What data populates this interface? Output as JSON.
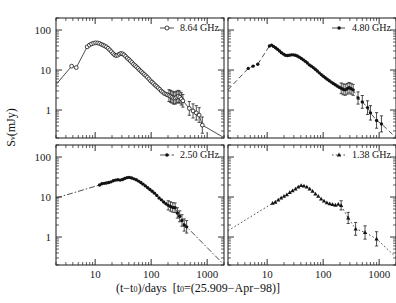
{
  "figure": {
    "title": "",
    "xlabel_parts": {
      "main": "(t−t",
      "sub": "0",
      "after": ")/days  [t",
      "sub2": "0",
      "tail": "=(25.909−Apr−98)]"
    },
    "xlabel_full": "(t−t0)/days [t0=(25.909−Apr−98)]",
    "ylabel_full": "Sν(mJy)",
    "ylabel_parts": {
      "s": "S",
      "nu": "ν",
      "unit": "(mJy)"
    },
    "background_color": "#ffffff",
    "axis_color": "#1a1a1a",
    "curve_color": "#3a3a3a",
    "marker_color": "#121212"
  },
  "chart_data": {
    "type": "scatter",
    "title": "",
    "xlabel": "(t−t0)/days [t0=(25.909−Apr−98)]",
    "ylabel": "Sν(mJy)",
    "xscale": "log",
    "yscale": "log",
    "xlim": [
      2,
      2000
    ],
    "ylim": [
      0.2,
      200
    ],
    "xticks": [
      10,
      100,
      1000
    ],
    "xticklabels": [
      "10",
      "100",
      "1000"
    ],
    "yticks": [
      1,
      10,
      100
    ],
    "yticklabels": [
      "1",
      "10",
      "100"
    ],
    "grid": false,
    "legend_position": "top-right-inside",
    "panel_layout": "2x2",
    "panels": [
      {
        "id": "panel-8-64",
        "row": 0,
        "col": 0,
        "legend_label": "8.64 GHz",
        "frequency_ghz": 8.64,
        "marker": "open-circle",
        "linestyle": "solid",
        "series": [
          {
            "name": "8.64 GHz",
            "x": [
              3.8,
              4.6,
              7.2,
              7.9,
              8.6,
              9.4,
              10.2,
              11.1,
              12.0,
              12.9,
              13.8,
              14.8,
              15.9,
              17.0,
              18.2,
              19.5,
              20.8,
              22.2,
              23.7,
              25.3,
              27.0,
              28.8,
              30.8,
              32.8,
              35.0,
              37.3,
              39.8,
              42.4,
              45.2,
              48.2,
              51.4,
              54.8,
              58.4,
              62.2,
              66.3,
              70.6,
              75.3,
              80.2,
              85.5,
              91.1,
              97.1,
              103.5,
              110.3,
              117.5,
              125.2,
              133.4,
              142.2,
              151.5,
              161.4,
              172.0,
              183.3,
              195.3,
              208.1,
              221.8,
              236.3,
              251.8,
              268.3,
              285.9,
              304.7,
              324.7,
              346.0,
              368.7,
              480.0,
              560.0,
              640.0,
              720.0,
              820.0
            ],
            "y": [
              12.5,
              11.5,
              38.0,
              42.0,
              45.0,
              47.0,
              48.0,
              47.5,
              46.0,
              44.0,
              42.0,
              40.0,
              38.0,
              35.0,
              32.0,
              29.0,
              26.0,
              24.0,
              23.0,
              23.5,
              25.0,
              26.0,
              25.5,
              24.0,
              22.0,
              20.0,
              18.5,
              17.0,
              15.5,
              14.0,
              13.0,
              12.0,
              11.0,
              10.0,
              9.2,
              8.5,
              7.8,
              7.2,
              6.6,
              6.0,
              5.4,
              5.0,
              4.6,
              4.2,
              3.9,
              3.6,
              3.3,
              3.0,
              2.8,
              2.6,
              2.5,
              2.4,
              2.3,
              2.2,
              2.1,
              2.0,
              2.0,
              2.1,
              2.2,
              2.1,
              1.9,
              1.7,
              1.1,
              0.95,
              0.85,
              0.75,
              0.42
            ]
          }
        ]
      },
      {
        "id": "panel-4-80",
        "row": 0,
        "col": 1,
        "legend_label": "4.80 GHz",
        "frequency_ghz": 4.8,
        "marker": "filled-circle",
        "linestyle": "dashed",
        "series": [
          {
            "name": "4.80 GHz",
            "x": [
              4.6,
              5.6,
              6.8,
              11.0,
              12.0,
              13.0,
              14.1,
              15.3,
              16.6,
              18.0,
              19.6,
              21.2,
              23.0,
              25.0,
              27.1,
              29.4,
              31.9,
              34.6,
              37.6,
              40.8,
              44.3,
              48.1,
              52.2,
              56.6,
              61.5,
              66.7,
              72.4,
              78.6,
              85.3,
              92.6,
              100.5,
              109.1,
              118.4,
              128.5,
              139.5,
              151.4,
              164.3,
              178.3,
              193.5,
              210.0,
              228.0,
              247.4,
              268.6,
              291.5,
              316.4,
              343.4,
              420.0,
              500.0,
              620.0,
              700.0,
              900.0,
              1100.0
            ],
            "y": [
              11.0,
              12.5,
              14.0,
              40.0,
              42.0,
              39.0,
              36.0,
              33.0,
              30.0,
              27.0,
              25.0,
              23.5,
              23.0,
              23.5,
              24.0,
              24.0,
              23.5,
              22.5,
              21.0,
              19.5,
              18.0,
              16.5,
              15.0,
              13.5,
              12.5,
              11.5,
              10.5,
              9.5,
              8.5,
              7.7,
              7.0,
              6.4,
              5.9,
              5.4,
              5.0,
              4.6,
              4.3,
              4.0,
              3.7,
              3.5,
              3.3,
              3.2,
              3.4,
              3.6,
              3.4,
              3.2,
              2.0,
              1.6,
              1.15,
              0.85,
              0.55,
              0.45
            ]
          }
        ]
      },
      {
        "id": "panel-2-50",
        "row": 1,
        "col": 0,
        "legend_label": "2.50 GHz",
        "frequency_ghz": 2.5,
        "marker": "filled-circle",
        "linestyle": "dash-dot",
        "series": [
          {
            "name": "2.50 GHz",
            "x": [
              12.0,
              13.2,
              14.5,
              15.9,
              17.5,
              19.2,
              21.1,
              23.2,
              25.5,
              28.0,
              30.8,
              33.8,
              37.1,
              40.8,
              44.8,
              49.2,
              54.1,
              59.4,
              65.3,
              71.7,
              78.8,
              86.6,
              95.1,
              104.5,
              114.8,
              126.1,
              138.5,
              152.2,
              167.2,
              183.7,
              201.8,
              221.7,
              243.6,
              267.6,
              294.0,
              323.0,
              355.0,
              390.0,
              430.0
            ],
            "y": [
              20.0,
              21.5,
              22.0,
              22.5,
              23.0,
              24.0,
              25.5,
              26.5,
              27.0,
              26.5,
              27.5,
              29.0,
              30.5,
              31.0,
              30.0,
              28.5,
              27.0,
              25.0,
              23.0,
              21.0,
              19.0,
              17.0,
              15.5,
              14.0,
              12.5,
              11.0,
              9.5,
              8.5,
              7.5,
              6.8,
              6.2,
              5.8,
              5.5,
              5.4,
              4.0,
              3.3,
              2.6,
              2.0,
              1.8
            ]
          }
        ]
      },
      {
        "id": "panel-1-38",
        "row": 1,
        "col": 1,
        "legend_label": "1.38 GHz",
        "frequency_ghz": 1.38,
        "marker": "filled-triangle",
        "linestyle": "dotted",
        "series": [
          {
            "name": "1.38 GHz",
            "x": [
              12.5,
              14.0,
              15.8,
              17.8,
              20.0,
              22.5,
              25.3,
              28.4,
              32.0,
              36.0,
              40.5,
              45.5,
              51.2,
              57.6,
              64.8,
              72.8,
              81.9,
              92.1,
              103.6,
              116.5,
              131.0,
              147.3,
              165.7,
              186.3,
              209.5,
              280.0,
              380.0,
              560.0,
              900.0
            ],
            "y": [
              7.0,
              7.5,
              8.5,
              9.5,
              10.5,
              11.5,
              13.0,
              14.5,
              16.0,
              18.0,
              19.5,
              19.0,
              18.0,
              16.0,
              14.0,
              12.0,
              10.5,
              9.0,
              8.0,
              7.2,
              6.8,
              6.5,
              6.3,
              6.6,
              6.2,
              3.0,
              1.6,
              1.3,
              0.9
            ]
          }
        ]
      }
    ]
  },
  "legend": {
    "entries": [
      {
        "id": "legend-8-64",
        "label": "8.64 GHz",
        "marker": "open-circle"
      },
      {
        "id": "legend-4-80",
        "label": "4.80 GHz",
        "marker": "filled-circle"
      },
      {
        "id": "legend-2-50",
        "label": "2.50 GHz",
        "marker": "filled-circle"
      },
      {
        "id": "legend-1-38",
        "label": "1.38 GHz",
        "marker": "filled-triangle"
      }
    ]
  },
  "axes_text": {
    "x_tick_labels": [
      "10",
      "100",
      "1000"
    ],
    "y_tick_labels": [
      "100",
      "10",
      "1"
    ]
  }
}
